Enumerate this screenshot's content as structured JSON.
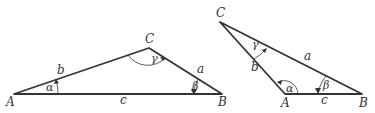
{
  "triangles": [
    {
      "name": "obtuse-at-C",
      "vertices": {
        "A": "A",
        "B": "B",
        "C": "C"
      },
      "sides": {
        "a": "a",
        "b": "b",
        "c": "c"
      },
      "angles": {
        "alpha": "α",
        "beta": "β",
        "gamma": "γ"
      }
    },
    {
      "name": "obtuse-at-A",
      "vertices": {
        "A": "A",
        "B": "B",
        "C": "C"
      },
      "sides": {
        "a": "a",
        "b": "b",
        "c": "c"
      },
      "angles": {
        "alpha": "α",
        "beta": "β",
        "gamma": "γ"
      }
    }
  ]
}
